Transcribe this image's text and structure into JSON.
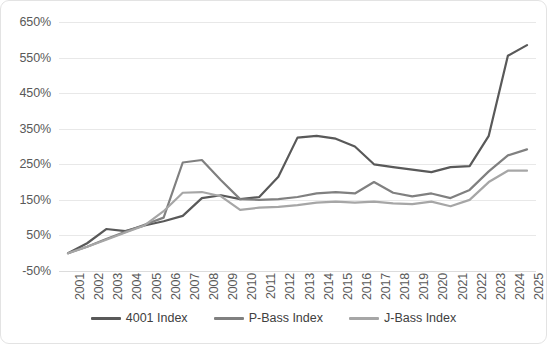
{
  "chart_data": {
    "type": "line",
    "title": "",
    "xlabel": "",
    "ylabel": "",
    "grid": true,
    "legend_position": "bottom",
    "ylim": [
      -50,
      650
    ],
    "ytick_labels": [
      "650%",
      "550%",
      "450%",
      "350%",
      "250%",
      "150%",
      "50%",
      "-50%"
    ],
    "ytick_values": [
      650,
      550,
      450,
      350,
      250,
      150,
      50,
      -50
    ],
    "categories": [
      "2001",
      "2002",
      "2003",
      "2004",
      "2005",
      "2006",
      "2007",
      "2008",
      "2009",
      "2010",
      "2011",
      "2012",
      "2013",
      "2014",
      "2015",
      "2016",
      "2017",
      "2018",
      "2019",
      "2020",
      "2021",
      "2022",
      "2023",
      "2024",
      "2025"
    ],
    "series": [
      {
        "name": "4001 Index",
        "color": "#595959",
        "values": [
          0,
          28,
          68,
          62,
          78,
          90,
          105,
          155,
          163,
          152,
          158,
          215,
          325,
          330,
          322,
          300,
          250,
          242,
          235,
          228,
          242,
          245,
          330,
          555,
          585
        ]
      },
      {
        "name": "P-Bass Index",
        "color": "#808080",
        "values": [
          0,
          18,
          40,
          60,
          80,
          100,
          255,
          262,
          205,
          152,
          150,
          152,
          158,
          168,
          172,
          168,
          200,
          170,
          160,
          168,
          155,
          178,
          230,
          275,
          292
        ]
      },
      {
        "name": "J-Bass Index",
        "color": "#a6a6a6",
        "values": [
          0,
          18,
          38,
          58,
          78,
          118,
          170,
          172,
          160,
          122,
          128,
          130,
          135,
          142,
          145,
          142,
          145,
          140,
          138,
          145,
          132,
          150,
          200,
          232,
          232
        ]
      }
    ]
  },
  "legend": {
    "entries": [
      {
        "label": "4001 Index",
        "color": "#595959"
      },
      {
        "label": "P-Bass Index",
        "color": "#808080"
      },
      {
        "label": "J-Bass Index",
        "color": "#a6a6a6"
      }
    ]
  }
}
